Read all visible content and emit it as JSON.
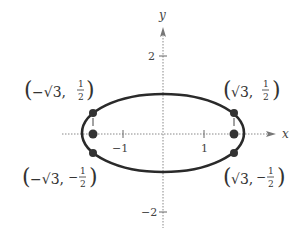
{
  "diagram": {
    "type": "ellipse-graph",
    "axes": {
      "x_label": "x",
      "y_label": "y",
      "x_ticks": [
        {
          "value": -1,
          "label": "−1"
        },
        {
          "value": 1,
          "label": "1"
        }
      ],
      "y_ticks": [
        {
          "value": 2,
          "label": "2"
        },
        {
          "value": -2,
          "label": "−2"
        }
      ]
    },
    "ellipse": {
      "center": [
        0,
        0
      ],
      "semi_major_x": 2,
      "semi_minor_y": 1
    },
    "points": [
      {
        "name": "upper-left",
        "label_x": "−√3,",
        "label_y_num": "1",
        "label_y_den": "2",
        "neg_y": false
      },
      {
        "name": "upper-right",
        "label_x": "√3,",
        "label_y_num": "1",
        "label_y_den": "2",
        "neg_y": false
      },
      {
        "name": "lower-left",
        "label_x": "−√3,",
        "label_y_num": "1",
        "label_y_den": "2",
        "neg_y": true
      },
      {
        "name": "lower-right",
        "label_x": "√3,",
        "label_y_num": "1",
        "label_y_den": "2",
        "neg_y": true
      },
      {
        "name": "left-focus",
        "label": ""
      },
      {
        "name": "right-focus",
        "label": ""
      }
    ],
    "labels": {
      "ul": "(−√3, 1/2)",
      "ur": "(√3, 1/2)",
      "ll": "(−√3, −1/2)",
      "lr": "(√3, −1/2)",
      "minus": "−",
      "one": "1",
      "two": "2"
    },
    "colors": {
      "curve": "#2a2a2a",
      "axis": "#888888",
      "point": "#333333"
    }
  }
}
